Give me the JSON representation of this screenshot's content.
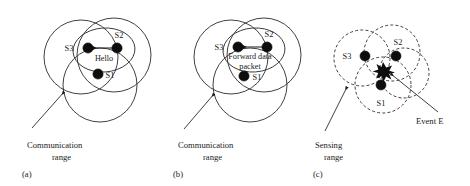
{
  "figure": {
    "background_color": "#ffffff",
    "stroke_color": "#2b2b2b",
    "node_color": "#0d0d0d"
  },
  "panels": [
    {
      "id": "a",
      "label": "(a)",
      "caption_line1": "Communication",
      "caption_line2": "range",
      "range_type": "Communication range",
      "line_style": "solid",
      "nodes": [
        {
          "id": "S3",
          "label": "S3"
        },
        {
          "id": "S2",
          "label": "S2"
        },
        {
          "id": "S1",
          "label": "S1"
        }
      ],
      "message": {
        "label": "Hello",
        "from": "S2",
        "to": "S3",
        "direction": "right-to-left"
      }
    },
    {
      "id": "b",
      "label": "(b)",
      "caption_line1": "Communication",
      "caption_line2": "range",
      "range_type": "Communication range",
      "line_style": "solid",
      "nodes": [
        {
          "id": "S3",
          "label": "S3"
        },
        {
          "id": "S2",
          "label": "S2"
        },
        {
          "id": "S1",
          "label": "S1"
        }
      ],
      "message": {
        "label_line1": "Forward data",
        "label_line2": "packet",
        "from": "S2",
        "to": "S3",
        "direction": "right-to-left"
      }
    },
    {
      "id": "c",
      "label": "(c)",
      "caption_line1": "Sensing",
      "caption_line2": "range",
      "range_type": "Sensing range",
      "line_style": "dashed",
      "nodes": [
        {
          "id": "S3",
          "label": "S3"
        },
        {
          "id": "S2",
          "label": "S2"
        },
        {
          "id": "S1",
          "label": "S1"
        }
      ],
      "event": {
        "label": "Event E",
        "marker": "star-burst"
      }
    }
  ]
}
